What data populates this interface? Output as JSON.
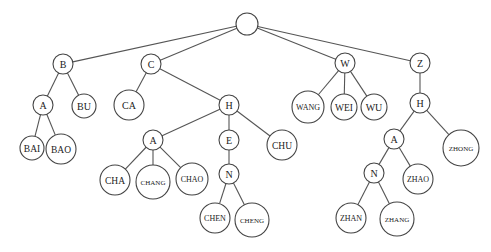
{
  "diagram": {
    "type": "trie",
    "nodes": [
      {
        "id": "root",
        "label": "",
        "x": 247,
        "y": 24,
        "r": 11
      },
      {
        "id": "B",
        "label": "B",
        "x": 63,
        "y": 64,
        "r": 10
      },
      {
        "id": "C",
        "label": "C",
        "x": 151,
        "y": 64,
        "r": 10
      },
      {
        "id": "W",
        "label": "W",
        "x": 345,
        "y": 63,
        "r": 10
      },
      {
        "id": "Z",
        "label": "Z",
        "x": 420,
        "y": 63,
        "r": 10
      },
      {
        "id": "B_A",
        "label": "A",
        "x": 43,
        "y": 105,
        "r": 10
      },
      {
        "id": "BU",
        "label": "BU",
        "x": 84,
        "y": 106,
        "r": 12
      },
      {
        "id": "BAI",
        "label": "BAI",
        "x": 32,
        "y": 148,
        "r": 12
      },
      {
        "id": "BAO",
        "label": "BAO",
        "x": 61,
        "y": 149,
        "r": 15
      },
      {
        "id": "CA",
        "label": "CA",
        "x": 129,
        "y": 105,
        "r": 15
      },
      {
        "id": "C_H",
        "label": "H",
        "x": 229,
        "y": 105,
        "r": 10
      },
      {
        "id": "CH_A",
        "label": "A",
        "x": 153,
        "y": 140,
        "r": 10
      },
      {
        "id": "CH_E",
        "label": "E",
        "x": 229,
        "y": 140,
        "r": 10
      },
      {
        "id": "CHU",
        "label": "CHU",
        "x": 282,
        "y": 145,
        "r": 15
      },
      {
        "id": "CHA",
        "label": "CHA",
        "x": 115,
        "y": 180,
        "r": 15
      },
      {
        "id": "CHANG",
        "label": "CHANG",
        "x": 153,
        "y": 182,
        "r": 17
      },
      {
        "id": "CHAO",
        "label": "CHAO",
        "x": 192,
        "y": 179,
        "r": 16
      },
      {
        "id": "CHE_N",
        "label": "N",
        "x": 229,
        "y": 174,
        "r": 10
      },
      {
        "id": "CHEN",
        "label": "CHEN",
        "x": 215,
        "y": 218,
        "r": 15
      },
      {
        "id": "CHENG",
        "label": "CHENG",
        "x": 252,
        "y": 220,
        "r": 17
      },
      {
        "id": "WANG",
        "label": "WANG",
        "x": 308,
        "y": 107,
        "r": 16
      },
      {
        "id": "WEI",
        "label": "WEI",
        "x": 344,
        "y": 107,
        "r": 13
      },
      {
        "id": "WU",
        "label": "WU",
        "x": 374,
        "y": 107,
        "r": 13
      },
      {
        "id": "Z_H",
        "label": "H",
        "x": 420,
        "y": 103,
        "r": 10
      },
      {
        "id": "ZH_A",
        "label": "A",
        "x": 394,
        "y": 139,
        "r": 10
      },
      {
        "id": "ZHONG",
        "label": "ZHONG",
        "x": 461,
        "y": 148,
        "r": 18
      },
      {
        "id": "ZHA_N",
        "label": "N",
        "x": 374,
        "y": 173,
        "r": 10
      },
      {
        "id": "ZHAO",
        "label": "ZHAO",
        "x": 418,
        "y": 179,
        "r": 15
      },
      {
        "id": "ZHAN",
        "label": "ZHAN",
        "x": 351,
        "y": 218,
        "r": 15
      },
      {
        "id": "ZHANG",
        "label": "ZHANG",
        "x": 397,
        "y": 219,
        "r": 17
      }
    ],
    "edges": [
      [
        "root",
        "B"
      ],
      [
        "root",
        "C"
      ],
      [
        "root",
        "W"
      ],
      [
        "root",
        "Z"
      ],
      [
        "B",
        "B_A"
      ],
      [
        "B",
        "BU"
      ],
      [
        "B_A",
        "BAI"
      ],
      [
        "B_A",
        "BAO"
      ],
      [
        "C",
        "CA"
      ],
      [
        "C",
        "C_H"
      ],
      [
        "C_H",
        "CH_A"
      ],
      [
        "C_H",
        "CH_E"
      ],
      [
        "C_H",
        "CHU"
      ],
      [
        "CH_A",
        "CHA"
      ],
      [
        "CH_A",
        "CHANG"
      ],
      [
        "CH_A",
        "CHAO"
      ],
      [
        "CH_E",
        "CHE_N"
      ],
      [
        "CHE_N",
        "CHEN"
      ],
      [
        "CHE_N",
        "CHENG"
      ],
      [
        "W",
        "WANG"
      ],
      [
        "W",
        "WEI"
      ],
      [
        "W",
        "WU"
      ],
      [
        "Z",
        "Z_H"
      ],
      [
        "Z_H",
        "ZH_A"
      ],
      [
        "Z_H",
        "ZHONG"
      ],
      [
        "ZH_A",
        "ZHA_N"
      ],
      [
        "ZH_A",
        "ZHAO"
      ],
      [
        "ZHA_N",
        "ZHAN"
      ],
      [
        "ZHA_N",
        "ZHANG"
      ]
    ]
  }
}
